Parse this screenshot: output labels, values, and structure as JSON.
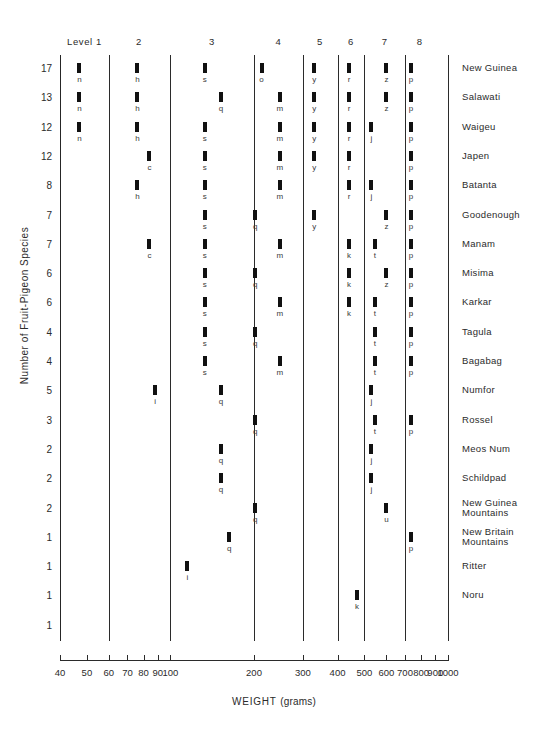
{
  "chart_data": {
    "type": "scatter",
    "title": "",
    "xlabel": "WEIGHT (grams)",
    "xlabel_main": "WEIGHT",
    "xlabel_unit": "(grams)",
    "ylabel": "Number of Fruit-Pigeon Species",
    "xscale": "log",
    "xlim": [
      40,
      1000
    ],
    "grid": false,
    "legend": "none",
    "xticks": [
      40,
      50,
      60,
      70,
      80,
      90,
      100,
      200,
      300,
      400,
      500,
      600,
      700,
      800,
      900,
      1000
    ],
    "xtick_labels": [
      "40",
      "50",
      "60",
      "70",
      "80",
      "90",
      "100",
      "200",
      "300",
      "400",
      "500",
      "600",
      "700",
      "800",
      "900",
      "1000"
    ],
    "level_boundaries": [
      40,
      60,
      100,
      200,
      300,
      400,
      500,
      700,
      1000
    ],
    "level_headers": [
      {
        "label": "Level 1",
        "center_weight": 49
      },
      {
        "label": "2",
        "center_weight": 77
      },
      {
        "label": "3",
        "center_weight": 141
      },
      {
        "label": "4",
        "center_weight": 245
      },
      {
        "label": "5",
        "center_weight": 346
      },
      {
        "label": "6",
        "center_weight": 447
      },
      {
        "label": "7",
        "center_weight": 592
      },
      {
        "label": "8",
        "center_weight": 790
      }
    ],
    "y_axis_tick_labels": [
      "17",
      "13",
      "12",
      "12",
      "8",
      "7",
      "7",
      "6",
      "6",
      "4",
      "4",
      "5",
      "3",
      "2",
      "2",
      "2",
      "1",
      "1",
      "1",
      "1"
    ],
    "rows": [
      {
        "count": "17",
        "island": "New Guinea",
        "marks": [
          {
            "w": 47,
            "letter": "n"
          },
          {
            "w": 76,
            "letter": "h"
          },
          {
            "w": 133,
            "letter": "s"
          },
          {
            "w": 213,
            "letter": "o"
          },
          {
            "w": 330,
            "letter": "y"
          },
          {
            "w": 440,
            "letter": "r"
          },
          {
            "w": 600,
            "letter": "z"
          },
          {
            "w": 735,
            "letter": "p"
          }
        ]
      },
      {
        "count": "13",
        "island": "Salawati",
        "marks": [
          {
            "w": 47,
            "letter": "n"
          },
          {
            "w": 76,
            "letter": "h"
          },
          {
            "w": 152,
            "letter": "q"
          },
          {
            "w": 248,
            "letter": "m"
          },
          {
            "w": 330,
            "letter": "y"
          },
          {
            "w": 440,
            "letter": "r"
          },
          {
            "w": 600,
            "letter": "z"
          },
          {
            "w": 735,
            "letter": "p"
          }
        ]
      },
      {
        "count": "12",
        "island": "Waigeu",
        "marks": [
          {
            "w": 47,
            "letter": "n"
          },
          {
            "w": 76,
            "letter": "h"
          },
          {
            "w": 133,
            "letter": "s"
          },
          {
            "w": 248,
            "letter": "m"
          },
          {
            "w": 330,
            "letter": "y"
          },
          {
            "w": 440,
            "letter": "r"
          },
          {
            "w": 530,
            "letter": "j"
          },
          {
            "w": 735,
            "letter": "p"
          }
        ]
      },
      {
        "count": "12",
        "island": "Japen",
        "marks": [
          {
            "w": 84,
            "letter": "c"
          },
          {
            "w": 133,
            "letter": "s"
          },
          {
            "w": 248,
            "letter": "m"
          },
          {
            "w": 330,
            "letter": "y"
          },
          {
            "w": 440,
            "letter": "r"
          },
          {
            "w": 735,
            "letter": "p"
          }
        ]
      },
      {
        "count": "8",
        "island": "Batanta",
        "marks": [
          {
            "w": 76,
            "letter": "h"
          },
          {
            "w": 133,
            "letter": "s"
          },
          {
            "w": 248,
            "letter": "m"
          },
          {
            "w": 440,
            "letter": "r"
          },
          {
            "w": 530,
            "letter": "j"
          },
          {
            "w": 735,
            "letter": "p"
          }
        ]
      },
      {
        "count": "7",
        "island": "Goodenough",
        "marks": [
          {
            "w": 133,
            "letter": "s"
          },
          {
            "w": 202,
            "letter": "q"
          },
          {
            "w": 330,
            "letter": "y"
          },
          {
            "w": 600,
            "letter": "z"
          },
          {
            "w": 735,
            "letter": "p"
          }
        ]
      },
      {
        "count": "7",
        "island": "Manam",
        "marks": [
          {
            "w": 84,
            "letter": "c"
          },
          {
            "w": 133,
            "letter": "s"
          },
          {
            "w": 248,
            "letter": "m"
          },
          {
            "w": 440,
            "letter": "k"
          },
          {
            "w": 545,
            "letter": "t"
          },
          {
            "w": 735,
            "letter": "p"
          }
        ]
      },
      {
        "count": "6",
        "island": "Misima",
        "marks": [
          {
            "w": 133,
            "letter": "s"
          },
          {
            "w": 202,
            "letter": "q"
          },
          {
            "w": 440,
            "letter": "k"
          },
          {
            "w": 600,
            "letter": "z"
          },
          {
            "w": 735,
            "letter": "p"
          }
        ]
      },
      {
        "count": "6",
        "island": "Karkar",
        "marks": [
          {
            "w": 133,
            "letter": "s"
          },
          {
            "w": 248,
            "letter": "m"
          },
          {
            "w": 440,
            "letter": "k"
          },
          {
            "w": 545,
            "letter": "t"
          },
          {
            "w": 735,
            "letter": "p"
          }
        ]
      },
      {
        "count": "4",
        "island": "Tagula",
        "marks": [
          {
            "w": 133,
            "letter": "s"
          },
          {
            "w": 202,
            "letter": "q"
          },
          {
            "w": 545,
            "letter": "t"
          },
          {
            "w": 735,
            "letter": "p"
          }
        ]
      },
      {
        "count": "4",
        "island": "Bagabag",
        "marks": [
          {
            "w": 133,
            "letter": "s"
          },
          {
            "w": 248,
            "letter": "m"
          },
          {
            "w": 545,
            "letter": "t"
          },
          {
            "w": 735,
            "letter": "p"
          }
        ]
      },
      {
        "count": "5",
        "island": "Numfor",
        "marks": [
          {
            "w": 88,
            "letter": "i"
          },
          {
            "w": 152,
            "letter": "q"
          },
          {
            "w": 530,
            "letter": "j"
          }
        ]
      },
      {
        "count": "3",
        "island": "Rossel",
        "marks": [
          {
            "w": 202,
            "letter": "q"
          },
          {
            "w": 545,
            "letter": "t"
          },
          {
            "w": 735,
            "letter": "p"
          }
        ]
      },
      {
        "count": "2",
        "island": "Meos Num",
        "marks": [
          {
            "w": 152,
            "letter": "q"
          },
          {
            "w": 530,
            "letter": "j"
          }
        ]
      },
      {
        "count": "2",
        "island": "Schildpad",
        "marks": [
          {
            "w": 152,
            "letter": "q"
          },
          {
            "w": 530,
            "letter": "j"
          }
        ]
      },
      {
        "count": "2",
        "island": "New Guinea\nMountains",
        "marks": [
          {
            "w": 202,
            "letter": "q"
          },
          {
            "w": 600,
            "letter": "u"
          }
        ]
      },
      {
        "count": "1",
        "island": "New Britain\nMountains",
        "marks": [
          {
            "w": 163,
            "letter": "q"
          },
          {
            "w": 735,
            "letter": "p"
          }
        ]
      },
      {
        "count": "1",
        "island": "Ritter",
        "marks": [
          {
            "w": 115,
            "letter": "i"
          }
        ]
      },
      {
        "count": "1",
        "island": "Noru",
        "marks": [
          {
            "w": 470,
            "letter": "k"
          }
        ]
      },
      {
        "count": "1",
        "island": "",
        "marks": []
      }
    ]
  }
}
